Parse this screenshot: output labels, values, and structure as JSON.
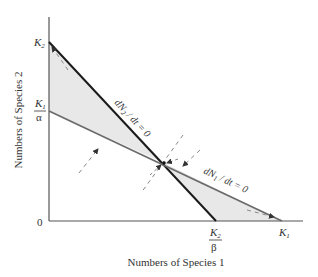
{
  "axes": {
    "xlabel": "Numbers of Species 1",
    "ylabel": "Numbers of Species 2",
    "origin_label": "0"
  },
  "ticks": {
    "y_top": {
      "num": "K",
      "sub": "2"
    },
    "y_mid": {
      "num": "K",
      "sub": "1",
      "den": "α"
    },
    "x_mid": {
      "num": "K",
      "sub": "2",
      "den": "β"
    },
    "x_right": {
      "num": "K",
      "sub": "1"
    }
  },
  "isoclines": {
    "species2": {
      "prefix": "dN",
      "sub": "2",
      "suffix": " / dt = 0"
    },
    "species1": {
      "prefix": "dN",
      "sub": "1",
      "suffix": " / dt = 0"
    }
  },
  "colors": {
    "species2_line": "#1a1a1a",
    "species1_line": "#6b6b6b",
    "shade": "#e6e6e6",
    "axis": "#555555",
    "arrow": "#888888"
  }
}
